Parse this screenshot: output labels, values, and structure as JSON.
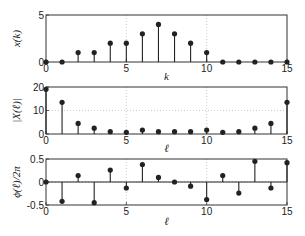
{
  "chart_data": [
    {
      "type": "stem",
      "title": "",
      "xlabel": "k",
      "ylabel": "x(k)",
      "x": [
        0,
        1,
        2,
        3,
        4,
        5,
        6,
        7,
        8,
        9,
        10,
        11,
        12,
        13,
        14,
        15
      ],
      "values": [
        0,
        0,
        1,
        1,
        2,
        2,
        3,
        4,
        3,
        2,
        1,
        0,
        0,
        0,
        0,
        0
      ],
      "xlim": [
        0,
        15
      ],
      "ylim": [
        0,
        5
      ],
      "xticks": [
        0,
        5,
        10,
        15
      ],
      "yticks": [
        0,
        5
      ],
      "xtick_labels": [
        "0",
        "5",
        "10",
        "15"
      ],
      "ytick_labels": [
        "0",
        "5"
      ],
      "grid": "dotted at ticks"
    },
    {
      "type": "stem",
      "title": "",
      "xlabel": "ℓ",
      "ylabel": "|X(ℓ)|",
      "x": [
        0,
        1,
        2,
        3,
        4,
        5,
        6,
        7,
        8,
        9,
        10,
        11,
        12,
        13,
        14,
        15
      ],
      "values": [
        19,
        13.5,
        4.5,
        2.5,
        1,
        0.7,
        1.7,
        1,
        1,
        1,
        1.7,
        0.7,
        1,
        2.5,
        4.5,
        13.5
      ],
      "xlim": [
        0,
        15
      ],
      "ylim": [
        0,
        20
      ],
      "xticks": [
        0,
        5,
        10,
        15
      ],
      "yticks": [
        0,
        10,
        20
      ],
      "xtick_labels": [
        "0",
        "5",
        "10",
        "15"
      ],
      "ytick_labels": [
        "0",
        "10",
        "20"
      ],
      "grid": "dotted at ticks"
    },
    {
      "type": "stem",
      "title": "",
      "xlabel": "ℓ",
      "ylabel": "ϕ(ℓ)/2π",
      "x": [
        0,
        1,
        2,
        3,
        4,
        5,
        6,
        7,
        8,
        9,
        10,
        11,
        12,
        13,
        14,
        15
      ],
      "values": [
        0,
        -0.42,
        0.14,
        -0.45,
        0.26,
        -0.13,
        0.38,
        0.1,
        0,
        -0.09,
        -0.38,
        0.14,
        -0.24,
        0.45,
        -0.13,
        0.42
      ],
      "xlim": [
        0,
        15
      ],
      "ylim": [
        -0.5,
        0.5
      ],
      "xticks": [
        0,
        5,
        10,
        15
      ],
      "yticks": [
        -0.5,
        0,
        0.5
      ],
      "xtick_labels": [
        "0",
        "5",
        "10",
        "15"
      ],
      "ytick_labels": [
        "-0.5",
        "0",
        "0.5"
      ],
      "grid": "dotted at ticks"
    }
  ],
  "colors": {
    "stem": "#222222",
    "axes": "#333333",
    "grid": "#aaaaaa"
  }
}
